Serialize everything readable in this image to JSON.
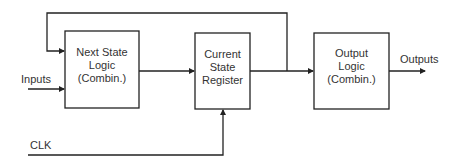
{
  "diagram": {
    "type": "finite-state-machine block diagram",
    "colors": {
      "line": "#222222",
      "text": "#333333",
      "background": "#ffffff"
    },
    "blocks": [
      {
        "id": "next_state_logic",
        "lines": [
          "Next State",
          "Logic",
          "(Combin.)"
        ]
      },
      {
        "id": "current_state_register",
        "lines": [
          "Current",
          "State",
          "Register"
        ]
      },
      {
        "id": "output_logic",
        "lines": [
          "Output",
          "Logic",
          "(Combin.)"
        ]
      }
    ],
    "signals": {
      "inputs": "Inputs",
      "outputs": "Outputs",
      "clock": "CLK"
    },
    "connections": [
      {
        "from": "Inputs",
        "to": "next_state_logic"
      },
      {
        "from": "next_state_logic",
        "to": "current_state_register"
      },
      {
        "from": "current_state_register",
        "to": "output_logic"
      },
      {
        "from": "current_state_register",
        "to": "next_state_logic",
        "kind": "feedback"
      },
      {
        "from": "CLK",
        "to": "current_state_register"
      },
      {
        "from": "output_logic",
        "to": "Outputs"
      }
    ]
  }
}
